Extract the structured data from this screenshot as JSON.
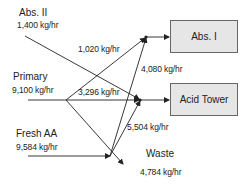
{
  "diagram": {
    "title": "",
    "sources": [
      {
        "id": "abs2",
        "name": "Abs. II",
        "flow": "1,400 kg/hr"
      },
      {
        "id": "primary",
        "name": "Primary",
        "flow": "9,100 kg/hr"
      },
      {
        "id": "fresh_aa",
        "name": "Fresh AA",
        "flow": "9,584 kg/hr"
      }
    ],
    "destinations": [
      {
        "id": "abs1",
        "name": "Abs. I"
      },
      {
        "id": "acid_tower",
        "name": "Acid Tower"
      },
      {
        "id": "waste",
        "name": "Waste",
        "flow": "4,784 kg/hr"
      }
    ],
    "streams": [
      {
        "from": "primary",
        "to": "abs1",
        "flow": "1,020 kg/hr"
      },
      {
        "from": "primary",
        "to": "acid_tower",
        "flow": "3,296 kg/hr"
      },
      {
        "from": "primary",
        "to": "waste",
        "flow": "4,784 kg/hr"
      },
      {
        "from": "fresh_aa",
        "to": "abs1",
        "flow": "4,080 kg/hr"
      },
      {
        "from": "fresh_aa",
        "to": "acid_tower",
        "flow": "5,504 kg/hr"
      },
      {
        "from": "abs2",
        "to": "acid_tower",
        "flow": "1,400 kg/hr"
      }
    ],
    "colors": {
      "line": "#222222",
      "box_fill": "#e6e6e6",
      "box_border": "#666666"
    }
  }
}
